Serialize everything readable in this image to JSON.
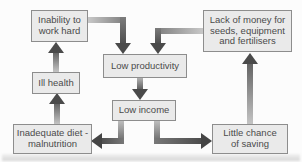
{
  "diagram": {
    "type": "cycle-of-poverty-flow-diagram",
    "nodes": [
      {
        "id": "inability",
        "label": "Inability to\nwork hard"
      },
      {
        "id": "lack-of-money",
        "label": "Lack of money for\nseeds, equipment\nand fertilisers"
      },
      {
        "id": "low-productivity",
        "label": "Low productivity"
      },
      {
        "id": "ill-health",
        "label": "Ill health"
      },
      {
        "id": "low-income",
        "label": "Low income"
      },
      {
        "id": "inadequate-diet",
        "label": "Inadequate diet -\nmalnutrition"
      },
      {
        "id": "little-chance",
        "label": "Little chance\nof saving"
      }
    ],
    "edges": [
      {
        "from": "inability",
        "to": "low-productivity"
      },
      {
        "from": "lack-of-money",
        "to": "low-productivity"
      },
      {
        "from": "low-productivity",
        "to": "low-income"
      },
      {
        "from": "low-income",
        "to": "inadequate-diet"
      },
      {
        "from": "low-income",
        "to": "little-chance"
      },
      {
        "from": "inadequate-diet",
        "to": "ill-health"
      },
      {
        "from": "ill-health",
        "to": "inability"
      },
      {
        "from": "little-chance",
        "to": "lack-of-money"
      }
    ],
    "colors": {
      "box_fill": "#eaeaea",
      "box_border": "#8d8d8d",
      "text": "#4a4a4a",
      "arrow_head": "#4a4a4a",
      "arrow_tail_light": "#c6c6c6",
      "background": "#fcfcfc"
    }
  }
}
